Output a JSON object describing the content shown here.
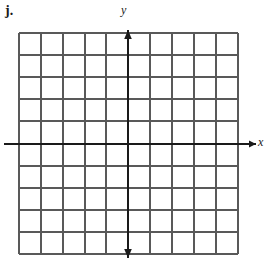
{
  "figure": {
    "problem_label": "j.",
    "y_axis_label": "y",
    "x_axis_label": "x",
    "background_color": "#ffffff",
    "grid_color": "#595959",
    "axis_color": "#1a1a1a",
    "label_color": "#1a1a1a"
  },
  "chart_data": {
    "type": "blank-coordinate-grid",
    "title": "",
    "xlabel": "x",
    "ylabel": "y",
    "grid": true,
    "grid_spacing_px": 22,
    "origin_px": [
      128,
      144
    ],
    "vertical_gridlines_px": [
      19,
      41,
      63,
      85,
      106,
      128,
      150,
      172,
      194,
      216,
      238
    ],
    "horizontal_gridlines_px": [
      33,
      55,
      77,
      99,
      121,
      144,
      166,
      188,
      210,
      232,
      254
    ],
    "x_axis": {
      "y_px": 144,
      "x_start_px": 4,
      "x_end_px": 256,
      "arrow_right": true,
      "arrow_left": false
    },
    "y_axis": {
      "x_px": 128,
      "y_start_px": 30,
      "y_end_px": 258,
      "arrow_up": true,
      "arrow_down": true
    },
    "series": [],
    "values": [],
    "categories": [],
    "tick_labels": [],
    "annotations": []
  }
}
